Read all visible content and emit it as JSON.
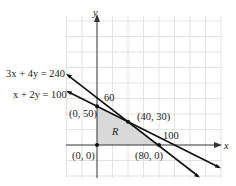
{
  "diagram": {
    "type": "linear-programming-feasible-region",
    "axes": {
      "x_label": "x",
      "y_label": "y"
    },
    "lines": [
      {
        "equation": "3x + 4y = 240",
        "label": "3x + 4y = 240"
      },
      {
        "equation": "x + 2y = 100",
        "label": "x + 2y = 100"
      }
    ],
    "intercept_labels": {
      "y_intercept_line1": "60",
      "x_intercept_line2": "100"
    },
    "region_label": "R",
    "vertices": [
      {
        "label": "(0, 0)",
        "x": 0,
        "y": 0
      },
      {
        "label": "(0, 50)",
        "x": 0,
        "y": 50
      },
      {
        "label": "(40, 30)",
        "x": 40,
        "y": 30
      },
      {
        "label": "(80, 0)",
        "x": 80,
        "y": 0
      }
    ],
    "grid_spacing": 20,
    "colors": {
      "region_fill": "#d9d9d9",
      "grid": "#dcdcdc",
      "line": "#111111"
    }
  }
}
